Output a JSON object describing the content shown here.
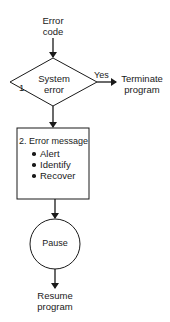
{
  "diagram": {
    "start": {
      "line1": "Error",
      "line2": "code"
    },
    "decision": {
      "number": "1.",
      "line1": "System",
      "line2": "error",
      "branch_label": "Yes"
    },
    "terminate": {
      "line1": "Terminate",
      "line2": "program"
    },
    "process": {
      "title": "2.  Error message",
      "items": [
        "Alert",
        "Identify",
        "Recover"
      ]
    },
    "pause": {
      "label": "Pause"
    },
    "end": {
      "line1": "Resume",
      "line2": "program"
    }
  }
}
